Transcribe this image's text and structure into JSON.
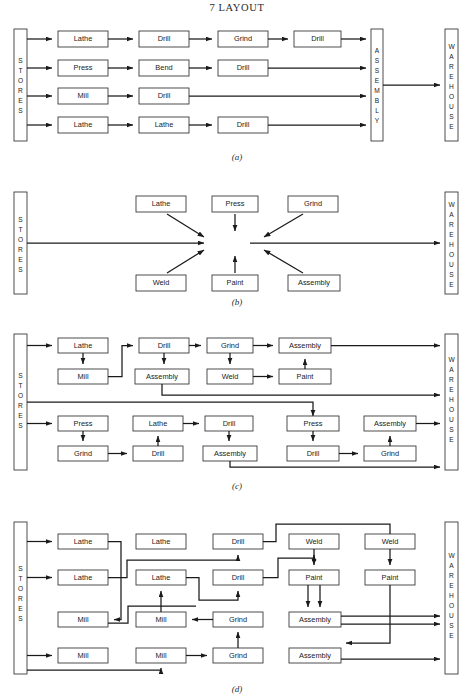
{
  "page": {
    "header": "7  LAYOUT"
  },
  "labels": {
    "stores": "STORES",
    "warehouse": "WAREHOUSE",
    "assembly_bar": "ASSEMBLY",
    "lathe": "Lathe",
    "drill": "Drill",
    "grind": "Grind",
    "press": "Press",
    "bend": "Bend",
    "mill": "Mill",
    "weld": "Weld",
    "paint": "Paint",
    "assembly": "Assembly"
  },
  "figures": [
    {
      "id": "a",
      "caption": "(a)",
      "description": "Product / line layout: four independent process lines run from Stores through a fixed machine sequence into a single Assembly department, which then feeds the Warehouse.",
      "stores_bar": {
        "label": "STORES"
      },
      "end_bar": {
        "label": "ASSEMBLY"
      },
      "warehouse_bar": {
        "label": "WAREHOUSE"
      },
      "rows": [
        {
          "boxes": [
            "Lathe",
            "Drill",
            "Grind",
            "Drill"
          ]
        },
        {
          "boxes": [
            "Press",
            "Bend",
            "Drill"
          ]
        },
        {
          "boxes": [
            "Mill",
            "Drill"
          ]
        },
        {
          "boxes": [
            "Lathe",
            "Lathe",
            "Drill"
          ]
        }
      ]
    },
    {
      "id": "b",
      "caption": "(b)",
      "description": "Process / functional layout shown schematically: Stores feeds a central work area served by all machine groups, which converge on the flow line before despatch to the Warehouse.",
      "stores_bar": {
        "label": "STORES"
      },
      "warehouse_bar": {
        "label": "WAREHOUSE"
      },
      "top_boxes": [
        "Lathe",
        "Press",
        "Grind"
      ],
      "bottom_boxes": [
        "Weld",
        "Paint",
        "Assembly"
      ]
    },
    {
      "id": "c",
      "caption": "(c)",
      "description": "Group / cell layout: two cells each contain a mixed set of machines, and work zig-zags within a cell before leaving for the Warehouse.",
      "stores_bar": {
        "label": "STORES"
      },
      "warehouse_bar": {
        "label": "WAREHOUSE"
      },
      "cell_top": {
        "upper": [
          "Lathe",
          "Drill",
          "Grind",
          "Assembly"
        ],
        "lower": [
          "Mill",
          "Assembly",
          "Weld",
          "Paint"
        ]
      },
      "cell_bottom": {
        "upper": [
          "Press",
          "Lathe",
          "Drill",
          "Press",
          "Assembly"
        ],
        "lower": [
          "Grind",
          "Drill",
          "Assembly",
          "Drill",
          "Grind"
        ]
      }
    },
    {
      "id": "d",
      "caption": "(d)",
      "description": "Functional layout with machines grouped by type: lathes, mills, grinders, drills, welding, painting and assembly sections, with complex cross traffic between sections.",
      "stores_bar": {
        "label": "STORES"
      },
      "warehouse_bar": {
        "label": "WAREHOUSE"
      },
      "grid": [
        [
          "Lathe",
          "Lathe",
          "Drill",
          "Weld",
          "Weld"
        ],
        [
          "Lathe",
          "Lathe",
          "Drill",
          "Paint",
          "Paint"
        ],
        [
          "Mill",
          "Mill",
          "Grind",
          "Assembly",
          ""
        ],
        [
          "Mill",
          "Mill",
          "Grind",
          "Assembly",
          ""
        ]
      ]
    }
  ]
}
